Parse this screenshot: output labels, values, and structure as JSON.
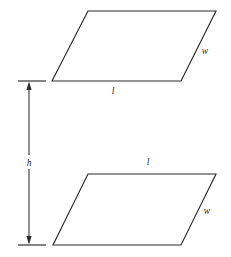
{
  "figure": {
    "stroke_color": "#2b2b2b",
    "background_color": "#ffffff"
  },
  "shapes": {
    "top_parallelogram": {
      "name": "top-parallelogram",
      "points": "88,11 216,11 181,81 52,81",
      "labels": {
        "length": {
          "text": "l",
          "x": 113,
          "y": 94
        },
        "width": {
          "text": "w",
          "x": 205,
          "y": 54
        }
      }
    },
    "bottom_parallelogram": {
      "name": "bottom-parallelogram",
      "points": "88,174 216,174 181,245 53,245",
      "labels": {
        "length": {
          "text": "l",
          "x": 148,
          "y": 165
        },
        "width": {
          "text": "w",
          "x": 207,
          "y": 214
        }
      }
    }
  },
  "dimension": {
    "name": "height-dimension",
    "label": {
      "text": "h",
      "x": 29,
      "y": 166
    },
    "axis_x": 29,
    "top_y": 81,
    "bottom_y": 245,
    "tick_left_x": 18,
    "tick_right_x": 46
  }
}
